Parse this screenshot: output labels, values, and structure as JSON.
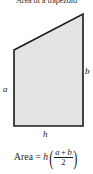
{
  "figure": {
    "title": "Area of a trapezoid",
    "background_color": "#ffffff",
    "shape": {
      "name": "trapezoid",
      "fill_color": "#e3e3e3",
      "stroke_color": "#1a1a1a",
      "stroke_width": 1.6,
      "points": "14,50 83,14 83,126 14,126"
    },
    "labels": {
      "left_side": "a",
      "right_side": "b",
      "base": "h"
    },
    "formula": {
      "word": "Area",
      "equals": "=",
      "multiplier": "h",
      "open_paren": "(",
      "numerator_a": "a",
      "plus": "+",
      "numerator_b": "b",
      "denominator": "2",
      "close_paren": ")",
      "plain_text": "Area = h((a + b)/2)"
    }
  }
}
